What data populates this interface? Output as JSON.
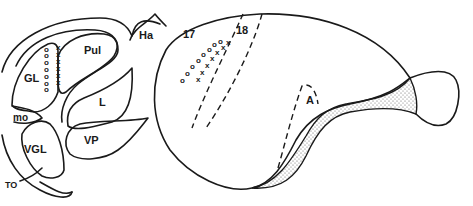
{
  "figure": {
    "type": "anatomical line drawing",
    "colors": {
      "ink": "#1a1a1a",
      "background": "#ffffff",
      "stipple": "#555555"
    }
  },
  "labels": {
    "pulvinar": "Pul",
    "habenula": "Ha",
    "lateral_geniculate": "GL",
    "lateral_nucleus": "L",
    "medial_ovoid": "mo",
    "ventral_lateral_geniculate": "VGL",
    "ventral_posterior": "VP",
    "optic_tract": "TO",
    "area_17": "17",
    "area_18": "18",
    "area_A": "A"
  },
  "markers": {
    "circle": "o",
    "cross": "x",
    "gl_circles_count": 7,
    "gl_crosses_count": 6,
    "cortex_circles_count": 8,
    "cortex_crosses_count": 7
  }
}
